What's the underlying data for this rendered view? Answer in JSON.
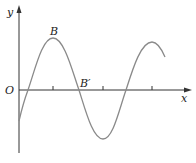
{
  "diagram": {
    "type": "sine-wave-graph",
    "axes": {
      "x_label": "x",
      "y_label": "y",
      "origin_label": "O"
    },
    "points": [
      {
        "name": "B",
        "label": "B",
        "role": "crest"
      },
      {
        "name": "B-prime",
        "label": "B′",
        "role": "x-axis intercept"
      }
    ],
    "colors": {
      "axis": "#333333",
      "curve": "#8a8a8a",
      "text": "#222222",
      "background": "#ffffff"
    }
  }
}
